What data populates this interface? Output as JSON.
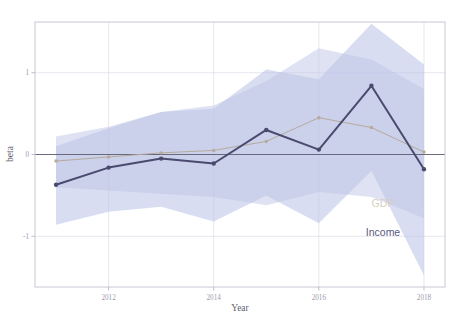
{
  "chart_data": {
    "type": "line",
    "title": "",
    "subtitle": "",
    "xlabel": "Year",
    "ylabel": "beta",
    "x": [
      2011,
      2012,
      2013,
      2014,
      2015,
      2016,
      2017,
      2018
    ],
    "xlim": [
      2010.6,
      2018.4
    ],
    "ylim": [
      -1.62,
      1.62
    ],
    "xticks": [
      2012,
      2014,
      2016,
      2018
    ],
    "xtick_labels": [
      "2012",
      "2014",
      "2016",
      "2018"
    ],
    "yticks": [
      -1,
      0,
      1
    ],
    "ytick_labels": [
      "-1",
      "0",
      "1"
    ],
    "grid": true,
    "grid_color": "#dcdce8",
    "zero_line": true,
    "zero_line_color": "#5e5e72",
    "legend_position": "inside-right",
    "background": "#ffffff",
    "panel_border_color": "#c8c8d4",
    "series": [
      {
        "name": "GDP",
        "label": "GDP",
        "color": "#b5aa9c",
        "band_color": "#c5cbe8",
        "band_opacity": 0.55,
        "marker": "circle",
        "values": [
          -0.08,
          -0.03,
          0.02,
          0.05,
          0.16,
          0.45,
          0.33,
          0.03
        ],
        "ci_upper": [
          0.22,
          0.34,
          0.52,
          0.6,
          0.9,
          1.3,
          1.16,
          0.8
        ],
        "ci_lower": [
          -0.4,
          -0.44,
          -0.48,
          -0.52,
          -0.62,
          -0.46,
          -0.52,
          -0.78
        ]
      },
      {
        "name": "Income",
        "label": "Income",
        "color": "#4a4a6e",
        "band_color": "#b9c1e6",
        "band_opacity": 0.55,
        "marker": "circle",
        "values": [
          -0.37,
          -0.16,
          -0.05,
          -0.11,
          0.3,
          0.06,
          0.84,
          -0.18
        ],
        "ci_upper": [
          0.1,
          0.32,
          0.52,
          0.56,
          1.04,
          0.92,
          1.6,
          1.1
        ],
        "ci_lower": [
          -0.86,
          -0.7,
          -0.64,
          -0.82,
          -0.5,
          -0.84,
          -0.2,
          -1.48
        ]
      }
    ],
    "legend": [
      {
        "label": "GDP",
        "color": "#d8cfc1"
      },
      {
        "label": "Income",
        "color": "#5a5a82"
      }
    ]
  },
  "axis": {
    "x_title": "Year",
    "y_title": "beta"
  }
}
